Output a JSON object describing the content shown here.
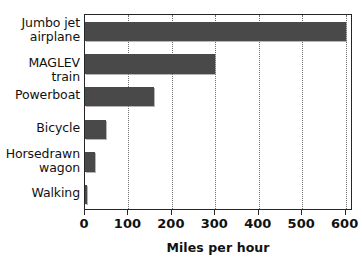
{
  "chart_data": {
    "type": "bar",
    "orientation": "horizontal",
    "title": "",
    "xlabel": "Miles per hour",
    "ylabel": "",
    "categories": [
      "Jumbo jet\nairplane",
      "MAGLEV train",
      "Powerboat",
      "Bicycle",
      "Horsedrawn\nwagon",
      "Walking"
    ],
    "values": [
      600,
      300,
      160,
      48,
      22,
      3
    ],
    "xlim": [
      0,
      617
    ],
    "xticks": [
      0,
      100,
      200,
      300,
      400,
      500,
      600
    ],
    "xticklabels": [
      "0",
      "100",
      "200",
      "300",
      "400",
      "500",
      "600"
    ],
    "grid": "vertical-dotted",
    "legend": null,
    "bar_color": "#494949",
    "axis_color": "#262626",
    "background_color": "#ffffff"
  }
}
